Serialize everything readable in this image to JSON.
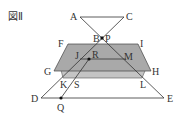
{
  "figure": {
    "title": "図Ⅱ",
    "labels": {
      "A": "A",
      "C": "C",
      "B": "B",
      "P": "P",
      "F": "F",
      "I": "I",
      "J": "J",
      "R": "R",
      "M": "M",
      "G": "G",
      "H": "H",
      "K": "K",
      "S": "S",
      "L": "L",
      "D": "D",
      "E": "E",
      "Q": "Q"
    },
    "colors": {
      "line": "#333333",
      "plane_fill": "#a9a9a9",
      "plane_back_fill": "#c4c4c4"
    }
  }
}
